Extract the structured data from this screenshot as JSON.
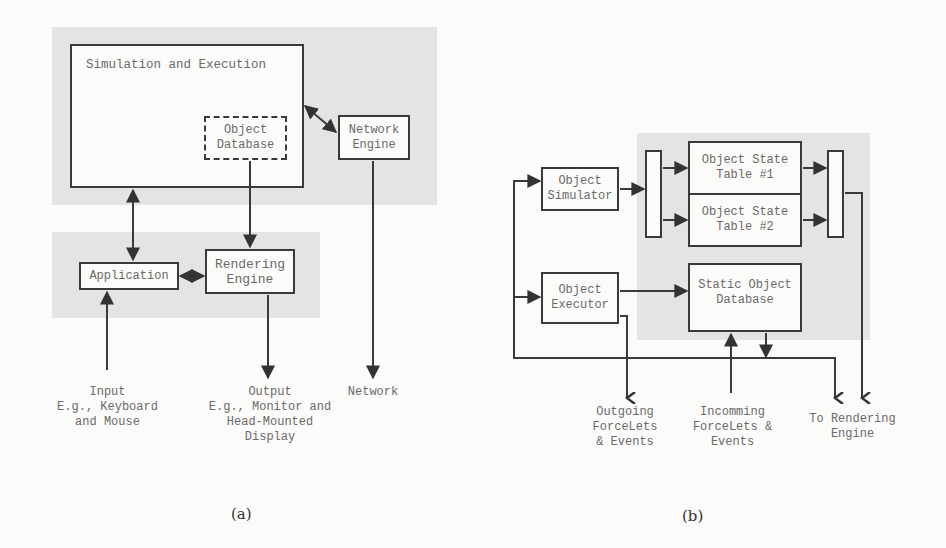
{
  "figure_a": {
    "caption": "(a)",
    "simulation_box": "Simulation and Execution",
    "object_database": "Object\nDatabase",
    "network_engine": "Network\nEngine",
    "application": "Application",
    "rendering_engine": "Rendering\nEngine",
    "input_label": "Input\nE.g., Keyboard\nand Mouse",
    "output_label": "Output\nE.g., Monitor and\nHead-Mounted\nDisplay",
    "network_label": "Network"
  },
  "figure_b": {
    "caption": "(b)",
    "object_simulator": "Object\nSimulator",
    "state_table_1": "Object State\nTable #1",
    "state_table_2": "Object State\nTable #2",
    "object_executor": "Object\nExecutor",
    "static_object_database": "Static Object\nDatabase",
    "outgoing_label": "Outgoing\nForceLets\n& Events",
    "incoming_label": "Incomming\nForceLets &\nEvents",
    "to_rendering_label": "To Rendering\nEngine"
  }
}
